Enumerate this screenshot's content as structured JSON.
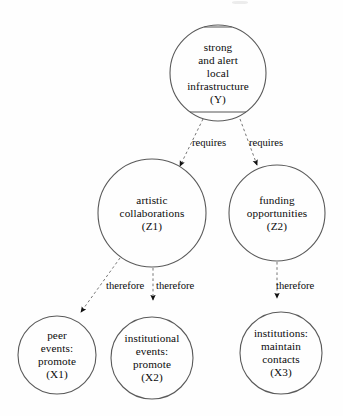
{
  "diagram": {
    "type": "concept-map",
    "background_color": "#fefefe",
    "stroke_color": "#5a5a5a",
    "text_color": "#0b0b0b",
    "nodes": [
      {
        "id": "Y",
        "name": "node-y-infrastructure",
        "label": "strong\nand alert\nlocal\ninfrastructure\n(Y)",
        "lines": [
          "strong",
          "and alert",
          "local",
          "infrastructure",
          "(Y)"
        ],
        "cx": 218,
        "cy": 73,
        "r": 48,
        "font_size": 11.2,
        "has_chords": true,
        "chord_top_y": 27,
        "chord_bottom_y": 112
      },
      {
        "id": "Z1",
        "name": "node-z1-artistic-collaborations",
        "label": "artistic\ncollaborations\n(Z1)",
        "lines": [
          "artistic",
          "collaborations",
          "(Z1)"
        ],
        "cx": 152,
        "cy": 213,
        "r": 54,
        "font_size": 11.2,
        "has_chords": false
      },
      {
        "id": "Z2",
        "name": "node-z2-funding-opportunities",
        "label": "funding\nopportunities\n(Z2)",
        "lines": [
          "funding",
          "opportunities",
          "(Z2)"
        ],
        "cx": 277,
        "cy": 213,
        "r": 48,
        "font_size": 11.2,
        "has_chords": false
      },
      {
        "id": "X1",
        "name": "node-x1-peer-events",
        "label": "peer\nevents:\npromote\n(X1)",
        "lines": [
          "peer",
          "events:",
          "promote",
          "(X1)"
        ],
        "cx": 57,
        "cy": 355,
        "r": 39,
        "font_size": 11.2,
        "has_chords": false
      },
      {
        "id": "X2",
        "name": "node-x2-institutional-events",
        "label": "institutional\nevents:\npromote\n(X2)",
        "lines": [
          "institutional",
          "events:",
          "promote",
          "(X2)"
        ],
        "cx": 152,
        "cy": 358,
        "r": 41,
        "font_size": 11.2,
        "has_chords": false
      },
      {
        "id": "X3",
        "name": "node-x3-institutions-maintain",
        "label": "institutions:\nmaintain\ncontacts\n(X3)",
        "lines": [
          "institutions:",
          "maintain",
          "contacts",
          "(X3)"
        ],
        "cx": 281,
        "cy": 353,
        "r": 41,
        "font_size": 11.2,
        "has_chords": false
      }
    ],
    "edges": [
      {
        "id": "e1",
        "name": "edge-y-to-z1",
        "from": "Y",
        "to": "Z1",
        "label": "requires",
        "style": "dashed",
        "arrow": "filled-triangle",
        "x1": 203,
        "y1": 119,
        "x2": 180,
        "y2": 166,
        "label_x": 192,
        "label_y": 138,
        "label_font_size": 10.6
      },
      {
        "id": "e2",
        "name": "edge-y-to-z2",
        "from": "Y",
        "to": "Z2",
        "label": "requires",
        "style": "dashed",
        "arrow": "filled-triangle",
        "x1": 240,
        "y1": 119,
        "x2": 257,
        "y2": 165,
        "label_x": 249,
        "label_y": 138,
        "label_font_size": 10.6
      },
      {
        "id": "e3",
        "name": "edge-z1-to-x1",
        "from": "Z1",
        "to": "X1",
        "label": "therefore",
        "style": "dashed",
        "arrow": "filled-triangle",
        "x1": 120,
        "y1": 258,
        "x2": 81,
        "y2": 312,
        "label_x": 106,
        "label_y": 281,
        "label_font_size": 10.6
      },
      {
        "id": "e4",
        "name": "edge-z1-to-x2",
        "from": "Z1",
        "to": "X2",
        "label": "therefore",
        "style": "dashed",
        "arrow": "filled-triangle",
        "x1": 153,
        "y1": 268,
        "x2": 153,
        "y2": 300,
        "label_x": 156,
        "label_y": 281,
        "label_font_size": 10.6
      },
      {
        "id": "e5",
        "name": "edge-z2-to-x3",
        "from": "Z2",
        "to": "X3",
        "label": "therefore",
        "style": "dashed",
        "arrow": "filled-triangle",
        "x1": 277,
        "y1": 262,
        "x2": 277,
        "y2": 298,
        "label_x": 276,
        "label_y": 281,
        "label_font_size": 10.6
      }
    ]
  }
}
